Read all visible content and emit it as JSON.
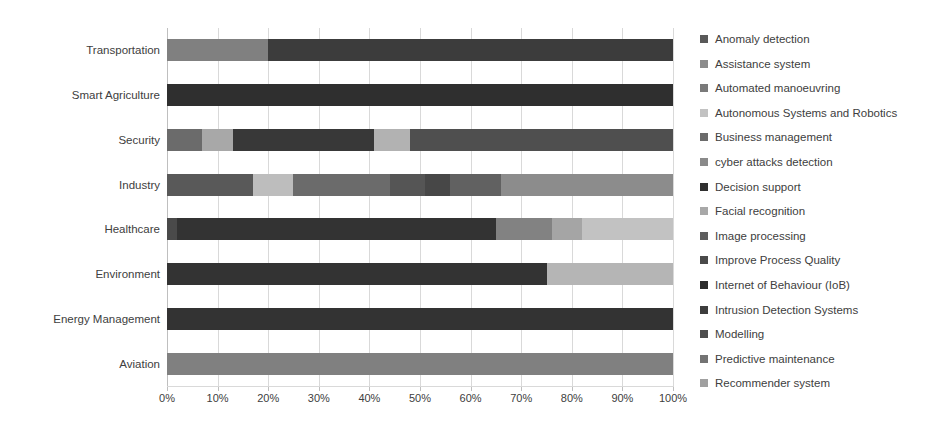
{
  "chart_data": {
    "type": "bar",
    "orientation": "horizontal",
    "stacked": true,
    "normalized": true,
    "title": "",
    "xlabel": "",
    "ylabel": "",
    "xlim": [
      0,
      100
    ],
    "grid": true,
    "legend_position": "right",
    "xtick_labels": [
      "0%",
      "10%",
      "20%",
      "30%",
      "40%",
      "50%",
      "60%",
      "70%",
      "80%",
      "90%",
      "100%"
    ],
    "xtick_values": [
      0,
      10,
      20,
      30,
      40,
      50,
      60,
      70,
      80,
      90,
      100
    ],
    "categories": [
      "Transportation",
      "Smart Agriculture",
      "Security",
      "Industry",
      "Healthcare",
      "Environment",
      "Energy Management",
      "Aviation"
    ],
    "series": [
      {
        "name": "Anomaly detection",
        "color": "#595959",
        "values": [
          0,
          0,
          0,
          0,
          0,
          0,
          0,
          0
        ]
      },
      {
        "name": "Assistance system",
        "color": "#808080",
        "values": [
          20,
          0,
          0,
          0,
          0,
          0,
          0,
          0
        ]
      },
      {
        "name": "Automated manoeuvring",
        "color": "#7f7f7f",
        "values": [
          0,
          0,
          0,
          0,
          0,
          0,
          0,
          100
        ]
      },
      {
        "name": "Autonomous Systems and Robotics",
        "color": "#bfbfbf",
        "values": [
          0,
          0,
          0,
          0,
          0,
          0,
          0,
          0
        ]
      },
      {
        "name": "Business management",
        "color": "#595959",
        "values": [
          0,
          0,
          0,
          0,
          0,
          0,
          0,
          0
        ]
      },
      {
        "name": "cyber attacks detection",
        "color": "#6e6e6e",
        "values": [
          0,
          0,
          13,
          0,
          0,
          0,
          0,
          0
        ]
      },
      {
        "name": "Decision support",
        "color": "#333333",
        "values": [
          80,
          100,
          0,
          0,
          63,
          0,
          100,
          0
        ]
      },
      {
        "name": "Facial recognition",
        "color": "#a6a6a6",
        "values": [
          0,
          0,
          7,
          0,
          0,
          0,
          0,
          0
        ]
      },
      {
        "name": "Image processing",
        "color": "#595959",
        "values": [
          0,
          0,
          0,
          17,
          0,
          0,
          0,
          0
        ]
      },
      {
        "name": "Improve Process Quality",
        "color": "#4a4a4a",
        "values": [
          0,
          0,
          0,
          0,
          0,
          0,
          0,
          0
        ]
      },
      {
        "name": "Internet of Behaviour (IoB)",
        "color": "#2b2b2b",
        "values": [
          0,
          0,
          0,
          0,
          2,
          0,
          0,
          0
        ]
      },
      {
        "name": "Intrusion Detection Systems",
        "color": "#3d3d3d",
        "values": [
          0,
          0,
          30,
          0,
          0,
          75,
          0,
          0
        ]
      },
      {
        "name": "Modelling",
        "color": "#4d4d4d",
        "values": [
          0,
          0,
          0,
          0,
          0,
          0,
          0,
          0
        ]
      },
      {
        "name": "Predictive maintenance",
        "color": "#737373",
        "values": [
          0,
          0,
          0,
          0,
          0,
          0,
          0,
          0
        ]
      },
      {
        "name": "Recommender system",
        "color": "#a0a0a0",
        "values": [
          0,
          0,
          0,
          0,
          0,
          0,
          0,
          0
        ]
      }
    ],
    "stacks": [
      {
        "category": "Transportation",
        "segments": [
          {
            "label": "Assistance system",
            "value": 20,
            "color": "#808080"
          },
          {
            "label": "Decision support",
            "value": 80,
            "color": "#3c3c3c"
          }
        ]
      },
      {
        "category": "Smart Agriculture",
        "segments": [
          {
            "label": "Decision support",
            "value": 100,
            "color": "#2f2f2f"
          }
        ]
      },
      {
        "category": "Security",
        "segments": [
          {
            "label": "cyber attacks detection",
            "value": 7,
            "color": "#6b6b6b"
          },
          {
            "label": "Facial recognition",
            "value": 6,
            "color": "#a8a8a8"
          },
          {
            "label": "Intrusion Detection Systems",
            "value": 28,
            "color": "#383838"
          },
          {
            "label": "Facial recognition",
            "value": 7,
            "color": "#b2b2b2"
          },
          {
            "label": "Anomaly detection",
            "value": 52,
            "color": "#4f4f4f"
          }
        ]
      },
      {
        "category": "Industry",
        "segments": [
          {
            "label": "Image processing",
            "value": 17,
            "color": "#595959"
          },
          {
            "label": "Recommender system",
            "value": 8,
            "color": "#bdbdbd"
          },
          {
            "label": "Improve Process Quality",
            "value": 19,
            "color": "#6b6b6b"
          },
          {
            "label": "Modelling",
            "value": 7,
            "color": "#555555"
          },
          {
            "label": "Business management",
            "value": 5,
            "color": "#474747"
          },
          {
            "label": "Predictive maintenance",
            "value": 10,
            "color": "#616161"
          },
          {
            "label": "Anomaly detection",
            "value": 34,
            "color": "#8c8c8c"
          }
        ]
      },
      {
        "category": "Healthcare",
        "segments": [
          {
            "label": "Internet of Behaviour (IoB)",
            "value": 2,
            "color": "#4a4a4a"
          },
          {
            "label": "Decision support",
            "value": 63,
            "color": "#333333"
          },
          {
            "label": "Image processing",
            "value": 11,
            "color": "#828282"
          },
          {
            "label": "Recommender system",
            "value": 6,
            "color": "#a5a5a5"
          },
          {
            "label": "Autonomous Systems and Robotics",
            "value": 18,
            "color": "#c2c2c2"
          }
        ]
      },
      {
        "category": "Environment",
        "segments": [
          {
            "label": "Intrusion Detection Systems",
            "value": 75,
            "color": "#333333"
          },
          {
            "label": "Autonomous Systems and Robotics",
            "value": 25,
            "color": "#b5b5b5"
          }
        ]
      },
      {
        "category": "Energy Management",
        "segments": [
          {
            "label": "Decision support",
            "value": 100,
            "color": "#333333"
          }
        ]
      },
      {
        "category": "Aviation",
        "segments": [
          {
            "label": "Automated manoeuvring",
            "value": 100,
            "color": "#808080"
          }
        ]
      }
    ]
  },
  "legend": {
    "items": [
      {
        "label": "Anomaly detection",
        "color": "#595959"
      },
      {
        "label": "Assistance system",
        "color": "#8c8c8c"
      },
      {
        "label": "Automated manoeuvring",
        "color": "#7a7a7a"
      },
      {
        "label": "Autonomous Systems and Robotics",
        "color": "#c2c2c2"
      },
      {
        "label": "Business management",
        "color": "#6b6b6b"
      },
      {
        "label": "cyber attacks detection",
        "color": "#8a8a8a"
      },
      {
        "label": "Decision support",
        "color": "#2f2f2f"
      },
      {
        "label": "Facial recognition",
        "color": "#a8a8a8"
      },
      {
        "label": "Image processing",
        "color": "#5e5e5e"
      },
      {
        "label": "Improve Process Quality",
        "color": "#4a4a4a"
      },
      {
        "label": "Internet of Behaviour (IoB)",
        "color": "#2b2b2b"
      },
      {
        "label": "Intrusion Detection Systems",
        "color": "#3d3d3d"
      },
      {
        "label": "Modelling",
        "color": "#4d4d4d"
      },
      {
        "label": "Predictive maintenance",
        "color": "#737373"
      },
      {
        "label": "Recommender system",
        "color": "#a0a0a0"
      }
    ]
  },
  "axis": {
    "grid_color": "#d9d9d9",
    "text_color": "#404040"
  }
}
